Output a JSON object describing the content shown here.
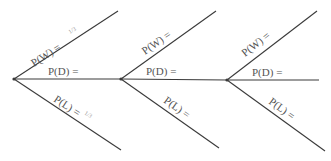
{
  "diagram": {
    "type": "tree-diagram",
    "stages": [
      {
        "vertex": [
          14,
          79
        ],
        "branches": [
          {
            "outcome": "W",
            "label": "P(W) =",
            "value": "1/3",
            "end": [
              118,
              11
            ]
          },
          {
            "outcome": "D",
            "label": "P(D) =",
            "value": "",
            "end": [
              120,
              79
            ]
          },
          {
            "outcome": "L",
            "label": "P(L) =",
            "value": "1/3",
            "end": [
              121,
              150
            ]
          }
        ]
      },
      {
        "vertex": [
          121,
          79
        ],
        "branches": [
          {
            "outcome": "W",
            "label": "P(W) =",
            "value": "",
            "end": [
              216,
              11
            ]
          },
          {
            "outcome": "D",
            "label": "P(D) =",
            "value": "",
            "end": [
              227,
              80
            ]
          },
          {
            "outcome": "L",
            "label": "P(L) =",
            "value": "",
            "end": [
              219,
              148
            ]
          }
        ]
      },
      {
        "vertex": [
          227,
          80
        ],
        "branches": [
          {
            "outcome": "W",
            "label": "P(W) =",
            "value": "",
            "end": [
              317,
              11
            ]
          },
          {
            "outcome": "D",
            "label": "P(D) =",
            "value": "",
            "end": [
              319,
              80
            ]
          },
          {
            "outcome": "L",
            "label": "P(L) =",
            "value": "",
            "end": [
              325,
              151
            ]
          }
        ]
      }
    ]
  },
  "colors": {
    "line": "#3a3a3a",
    "text": "#555555",
    "background": "#ffffff"
  }
}
